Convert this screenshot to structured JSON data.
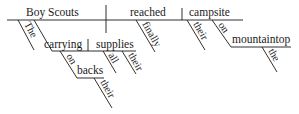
{
  "diagram": {
    "type": "Reed-Kellogg sentence diagram",
    "sentence_parts": {
      "subject": "Boy Scouts",
      "verb": "reached",
      "direct_object": "campsite"
    },
    "modifiers": {
      "subject_article": "The",
      "participle": "carrying",
      "participle_object": "supplies",
      "prep_1": "on",
      "prep_1_object": "backs",
      "backs_modifier": "their",
      "supplies_modifier_1": "all",
      "supplies_modifier_2": "their",
      "adverb": "finally",
      "object_modifier": "their",
      "prep_2": "on",
      "prep_2_object": "mountaintop",
      "mountaintop_article": "the"
    }
  }
}
